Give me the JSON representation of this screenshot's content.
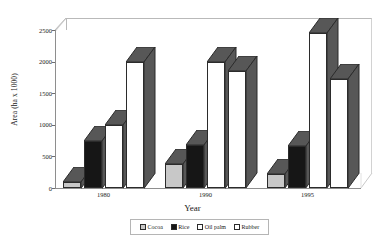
{
  "chart_data": {
    "type": "bar",
    "title": "",
    "subtitle": "",
    "xlabel": "Year",
    "ylabel": "Area (ha x 1000)",
    "categories": [
      "1980",
      "1990",
      "1995"
    ],
    "series": [
      {
        "name": "Cocoa",
        "values": [
          100,
          380,
          220
        ],
        "color": "#c8c8c8"
      },
      {
        "name": "Rice",
        "values": [
          750,
          680,
          660
        ],
        "color": "#161616"
      },
      {
        "name": "Oil palm",
        "values": [
          1000,
          2000,
          2450
        ],
        "color": "#ffffff"
      },
      {
        "name": "Rubber",
        "values": [
          2000,
          1850,
          1730
        ],
        "color": "#ffffff"
      }
    ],
    "ylim": [
      0,
      2500
    ],
    "yticks": [
      0,
      500,
      1000,
      1500,
      2000,
      2500
    ],
    "ytick_labels": [
      "0",
      "500",
      "1000",
      "1500",
      "2000",
      "2500"
    ],
    "grid": false,
    "legend_position": "bottom",
    "three_d": true,
    "bar_shade_color": "#575757",
    "bar_outline_color": "#2b2b2b"
  },
  "axes": {
    "y_title": "Area (ha x 1000)",
    "x_title": "Year",
    "y_tick_labels": [
      "2500",
      "2000",
      "1500",
      "1000",
      "500",
      "0"
    ],
    "x_tick_labels": [
      "1980",
      "1990",
      "1995"
    ]
  },
  "legend": {
    "items": [
      {
        "label": "Cocoa",
        "swatch": "#c8c8c8"
      },
      {
        "label": "Rice",
        "swatch": "#161616"
      },
      {
        "label": "Oil palm",
        "swatch": "#ffffff"
      },
      {
        "label": "Rubber",
        "swatch": "#ffffff"
      }
    ]
  }
}
